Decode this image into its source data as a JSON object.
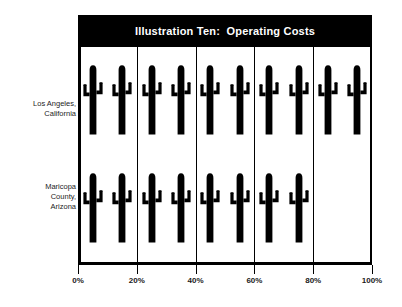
{
  "title": "Illustration Ten:  Operating Costs",
  "colors": {
    "banner_background": "#000000",
    "banner_text": "#ffffff",
    "plot_background": "#ffffff",
    "frame": "#000000",
    "icon": "#000000",
    "label_text": "#1c1c1c",
    "page_background": "#ffffff"
  },
  "icon_name": "cactus-icon",
  "rows": [
    {
      "label_lines": [
        "Los Angeles,",
        "California"
      ],
      "value": 100,
      "icon_count": 10
    },
    {
      "label_lines": [
        "Maricopa",
        "County,",
        "Arizona"
      ],
      "value": 80,
      "icon_count": 8
    }
  ],
  "axis": {
    "ticks": [
      {
        "label": "0%",
        "value": 0
      },
      {
        "label": "20%",
        "value": 20
      },
      {
        "label": "40%",
        "value": 40
      },
      {
        "label": "60%",
        "value": 60
      },
      {
        "label": "80%",
        "value": 80
      },
      {
        "label": "100%",
        "value": 100
      }
    ],
    "min": 0,
    "max": 100
  },
  "gridlines": [
    20,
    40,
    60,
    80
  ],
  "chart_data": {
    "type": "bar",
    "subtype": "pictogram",
    "title": "Illustration Ten:  Operating Costs",
    "xlabel": "",
    "ylabel": "",
    "categories": [
      "Los Angeles, California",
      "Maricopa County, Arizona"
    ],
    "values": [
      100,
      80
    ],
    "value_unit": "%",
    "icon_unit_value": 10,
    "icon_counts": [
      10,
      8
    ],
    "icon_symbol": "cactus",
    "xlim": [
      0,
      100
    ],
    "xtick_labels": [
      "0%",
      "20%",
      "40%",
      "60%",
      "80%",
      "100%"
    ],
    "xtick_values": [
      0,
      20,
      40,
      60,
      80,
      100
    ],
    "grid": true,
    "grid_axis": "x",
    "legend": "none",
    "orientation": "horizontal"
  }
}
